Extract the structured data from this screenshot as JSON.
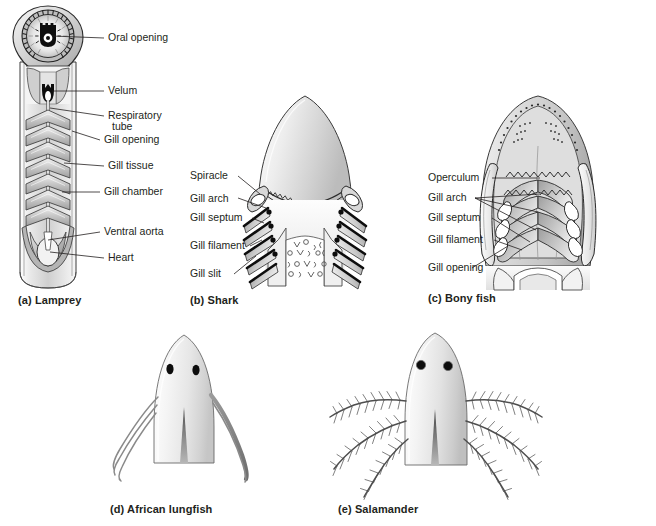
{
  "figure": {
    "background": "#ffffff",
    "ink": "#231f20"
  },
  "panels": [
    {
      "id": "a",
      "caption": "(a) Lamprey",
      "subject": "lamprey",
      "view": "ventral cutaway of head and gill region",
      "labels": [
        {
          "name": "oral-opening",
          "text": "Oral opening"
        },
        {
          "name": "velum",
          "text": "Velum"
        },
        {
          "name": "respiratory-tube",
          "text": "Respiratory"
        },
        {
          "name": "respiratory-tube-2",
          "text": "tube"
        },
        {
          "name": "gill-opening",
          "text": "Gill opening"
        },
        {
          "name": "gill-tissue",
          "text": "Gill tissue"
        },
        {
          "name": "gill-chamber",
          "text": "Gill chamber"
        },
        {
          "name": "ventral-aorta",
          "text": "Ventral aorta"
        },
        {
          "name": "heart",
          "text": "Heart"
        }
      ]
    },
    {
      "id": "b",
      "caption": "(b) Shark",
      "subject": "shark",
      "view": "ventral view of head showing gill slits",
      "labels": [
        {
          "name": "spiracle",
          "text": "Spiracle"
        },
        {
          "name": "gill-arch",
          "text": "Gill arch"
        },
        {
          "name": "gill-septum",
          "text": "Gill septum"
        },
        {
          "name": "gill-filament",
          "text": "Gill filament"
        },
        {
          "name": "gill-slit",
          "text": "Gill slit"
        }
      ]
    },
    {
      "id": "c",
      "caption": "(c) Bony fish",
      "subject": "bony fish",
      "view": "ventral view of head showing operculum and gill arches",
      "labels": [
        {
          "name": "operculum",
          "text": "Operculum"
        },
        {
          "name": "gill-arch",
          "text": "Gill arch"
        },
        {
          "name": "gill-septum",
          "text": "Gill septum"
        },
        {
          "name": "gill-filament",
          "text": "Gill filament"
        },
        {
          "name": "gill-opening",
          "text": "Gill opening"
        }
      ]
    },
    {
      "id": "d",
      "caption": "(d) African lungfish",
      "subject": "African lungfish",
      "view": "dorsal view of head with thread-like external gills",
      "labels": []
    },
    {
      "id": "e",
      "caption": "(e) Salamander",
      "subject": "salamander larva",
      "view": "dorsal view of head with feathery external gills",
      "labels": []
    }
  ]
}
